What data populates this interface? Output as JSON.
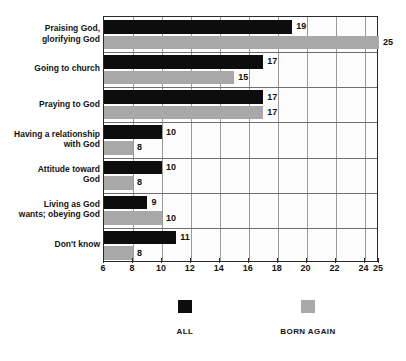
{
  "chart_data": {
    "type": "bar",
    "orientation": "horizontal",
    "title": "",
    "subtitle": "",
    "xlabel": "",
    "ylabel": "",
    "xlim": [
      6,
      25
    ],
    "grid": true,
    "legend_position": "bottom",
    "categories": [
      "Praising God,\nglorifying God",
      "Going to church",
      "Praying to God",
      "Having a relationship\nwith God",
      "Attitude toward\nGod",
      "Living as God\nwants; obeying God",
      "Don't know"
    ],
    "series": [
      {
        "name": "ALL",
        "color": "#0d0d0d",
        "values": [
          19,
          17,
          17,
          10,
          10,
          9,
          11
        ]
      },
      {
        "name": "BORN AGAIN",
        "color": "#a8a8a8",
        "values": [
          25,
          15,
          17,
          8,
          8,
          10,
          8
        ]
      }
    ],
    "xticks": [
      6,
      8,
      10,
      12,
      14,
      16,
      18,
      20,
      22,
      24,
      25
    ],
    "xticklabels": [
      "6",
      "8",
      "10",
      "12",
      "14",
      "16",
      "18",
      "20",
      "22",
      "24",
      "25"
    ]
  },
  "legend": {
    "items": [
      {
        "label": "ALL",
        "swatch": "black-square-swatch"
      },
      {
        "label": "BORN AGAIN",
        "swatch": "gray-square-swatch"
      }
    ]
  }
}
